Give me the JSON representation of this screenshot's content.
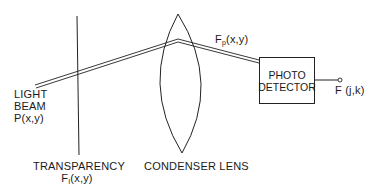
{
  "diagram": {
    "type": "optical-system",
    "labels": {
      "light_beam_line1": "LIGHT",
      "light_beam_line2": "BEAM",
      "light_beam_line3": "P(x,y)",
      "transparency": "TRANSPARENCY",
      "transparency_func_base": "F",
      "transparency_func_sub": "I",
      "transparency_func_args": "(x,y)",
      "lens": "CONDENSER LENS",
      "beam_func_base": "F",
      "beam_func_sub": "p",
      "beam_func_args": "(x,y)",
      "detector_line1": "PHOTO",
      "detector_line2": "DETECTOR",
      "output": "F (j,k)"
    },
    "colors": {
      "line": "#222222",
      "background": "#ffffff"
    }
  }
}
